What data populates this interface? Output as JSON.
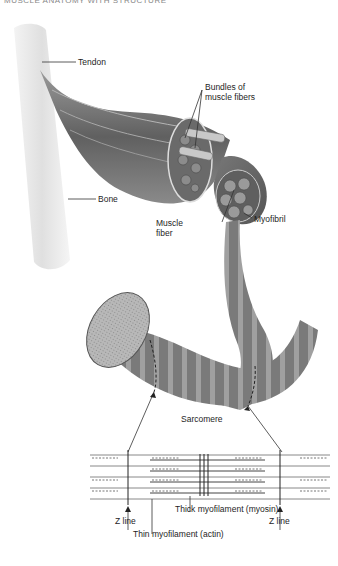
{
  "title_partial": "MUSCLE ANATOMY WITH STRUCTURE",
  "labels": {
    "tendon": "Tendon",
    "bundles_line1": "Bundles of",
    "bundles_line2": "muscle fibers",
    "bone": "Bone",
    "muscle_fiber_line1": "Muscle",
    "muscle_fiber_line2": "fiber",
    "myofibril": "Myofibril",
    "sarcomere": "Sarcomere",
    "z_line_left": "Z line",
    "z_line_right": "Z line",
    "thick_myofilament": "Thick myofilament (myosin)",
    "thin_myofilament": "Thin myofilament (actin)"
  },
  "colors": {
    "muscle_dark": "#5a5a5a",
    "muscle_mid": "#8a8a8a",
    "bone": "#e4e4e4",
    "line": "#333333"
  }
}
